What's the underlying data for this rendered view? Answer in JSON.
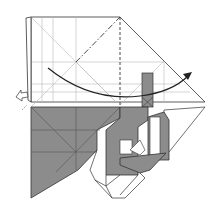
{
  "diagram": {
    "type": "origami-fold-step",
    "colors": {
      "paper_white": "#ffffff",
      "paper_gray": "#8c8c8c",
      "line": "#333333",
      "crease": "#b8b8b8",
      "arrow": "#222222"
    },
    "symbols": [
      {
        "name": "mountain-fold-line",
        "style": "dash-dot",
        "from": [
          76,
          62
        ],
        "to": [
          120,
          17
        ]
      },
      {
        "name": "valley-fold-line",
        "style": "dashed",
        "from": [
          120,
          17
        ],
        "to": [
          120,
          107
        ]
      },
      {
        "name": "fold-arrow",
        "style": "curved",
        "from": [
          48,
          68
        ],
        "to": [
          190,
          74
        ]
      },
      {
        "name": "push-arrow",
        "style": "hollow",
        "position": [
          22,
          92
        ]
      }
    ]
  }
}
